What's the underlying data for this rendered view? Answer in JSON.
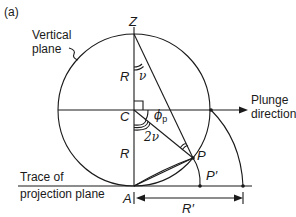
{
  "figure": {
    "panel_label": "(a)",
    "labels": {
      "vertical_plane_line1": "Vertical",
      "vertical_plane_line2": "plane",
      "plunge_line1": "Plunge",
      "plunge_line2": "direction",
      "trace_line1": "Trace of",
      "trace_line2": "projection plane"
    },
    "points": {
      "Z": "Z",
      "C": "C",
      "A": "A",
      "P": "P",
      "P_prime": "P′"
    },
    "measures": {
      "R_upper": "R",
      "R_lower": "R",
      "R_prime": "R′",
      "nu": "ν",
      "two_nu": "2ν",
      "phi": "ϕ",
      "phi_sub": "p"
    },
    "colors": {
      "ink": "#1a1a1a",
      "background": "#ffffff"
    }
  }
}
